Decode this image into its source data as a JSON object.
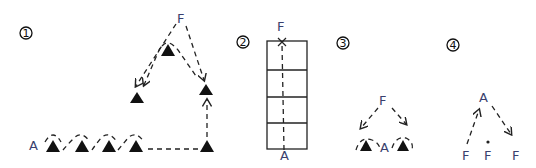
{
  "diagrams": [
    {
      "number": "1",
      "number_glyph": "①",
      "labels": {
        "start": "A",
        "finish": "F"
      },
      "cone_count": 8,
      "description": "Four cones in a row from A, dashed weave path then straight to corner cone, up to cone, then to F; F splits to apex cone and two side cones"
    },
    {
      "number": "2",
      "number_glyph": "②",
      "labels": {
        "start": "A",
        "finish": "F"
      },
      "grid_cells": 4,
      "description": "Vertical ladder of four boxes with dashed line from A at bottom to F at top"
    },
    {
      "number": "3",
      "number_glyph": "③",
      "labels": {
        "start": "A",
        "finish": "F"
      },
      "cone_count": 2,
      "description": "F at top with dashed arrows down to two cones flanking A"
    },
    {
      "number": "4",
      "number_glyph": "④",
      "labels": {
        "apex": "A",
        "f_left": "F",
        "f_middle": "F",
        "f_right": "F"
      },
      "description": "A at top, dashed arrow up from left F to A, dashed arrow from A down to right F, middle F with dot"
    }
  ],
  "colors": {
    "ink": "#111111",
    "label": "#3a3f6e",
    "background": "#ffffff"
  }
}
